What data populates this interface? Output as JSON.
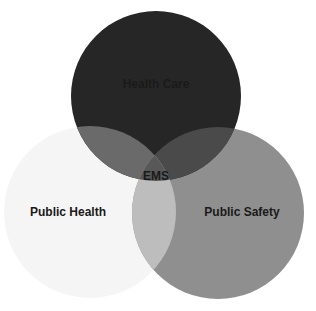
{
  "diagram": {
    "type": "venn",
    "circles": [
      {
        "label": "Health Care",
        "color": "#2a2a2a",
        "cx": 156,
        "cy": 96,
        "r": 85
      },
      {
        "label": "Public Health",
        "color": "#f4f4f4",
        "cx": 90,
        "cy": 212,
        "r": 86
      },
      {
        "label": "Public Safety",
        "color": "#8e8e8e",
        "cx": 218,
        "cy": 213,
        "r": 86
      }
    ],
    "center_label": "EMS",
    "labels": {
      "health_care": "Health Care",
      "public_health": "Public Health",
      "public_safety": "Public Safety",
      "ems": "EMS"
    }
  }
}
